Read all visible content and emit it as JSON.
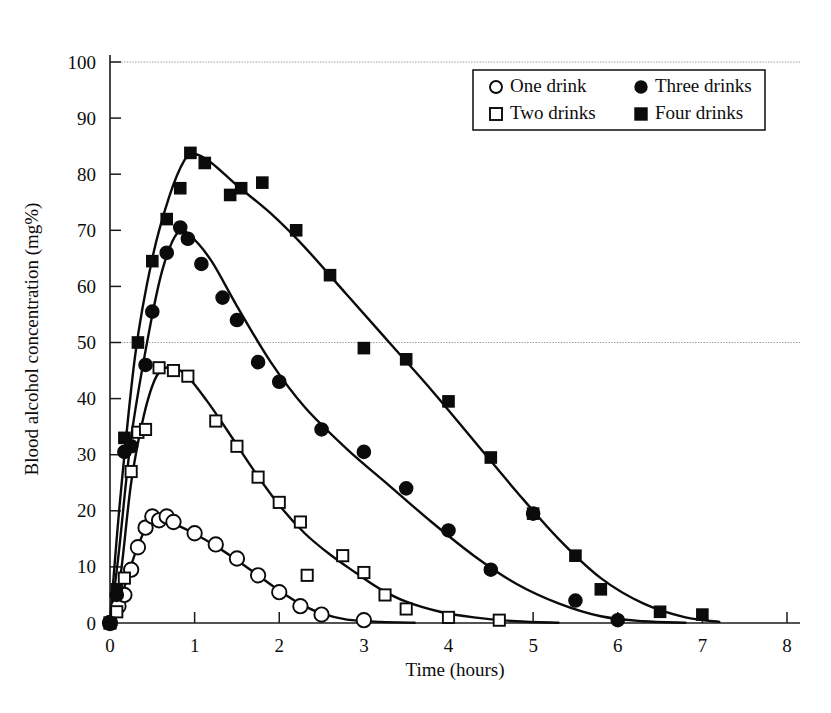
{
  "chart_data": {
    "type": "line",
    "title": "",
    "subtitle": "",
    "xlabel": "Time (hours)",
    "ylabel": "Blood alcohol concentration (mg%)",
    "xlim": [
      0,
      8
    ],
    "ylim": [
      0,
      105
    ],
    "xticks": [
      0,
      1,
      2,
      3,
      4,
      5,
      6,
      7,
      8
    ],
    "xtick_labels": [
      "0",
      "1",
      "2",
      "3",
      "4",
      "5",
      "6",
      "7",
      "8"
    ],
    "yticks": [
      0,
      10,
      20,
      30,
      40,
      50,
      60,
      70,
      80,
      90,
      100
    ],
    "ytick_labels": [
      "0",
      "10",
      "20",
      "30",
      "40",
      "50",
      "60",
      "70",
      "80",
      "90",
      "100"
    ],
    "grid": false,
    "reference_lines": [
      {
        "y": 50,
        "style": "dotted",
        "color": "#9a9a9a"
      },
      {
        "y": 100,
        "style": "dotted",
        "color": "#9a9a9a"
      }
    ],
    "legend_position": "top-right",
    "legend_entries": [
      "One drink",
      "Two drinks",
      "Three drinks",
      "Four drinks"
    ],
    "series": [
      {
        "name": "One drink",
        "marker": "open-circle",
        "points": [
          {
            "x": 0.0,
            "y": 0.0
          },
          {
            "x": 0.1,
            "y": 3.0
          },
          {
            "x": 0.17,
            "y": 5.0
          },
          {
            "x": 0.25,
            "y": 9.5
          },
          {
            "x": 0.33,
            "y": 13.5
          },
          {
            "x": 0.42,
            "y": 17.0
          },
          {
            "x": 0.5,
            "y": 19.0
          },
          {
            "x": 0.58,
            "y": 18.3
          },
          {
            "x": 0.67,
            "y": 19.0
          },
          {
            "x": 0.75,
            "y": 18.0
          },
          {
            "x": 1.0,
            "y": 16.0
          },
          {
            "x": 1.25,
            "y": 14.0
          },
          {
            "x": 1.5,
            "y": 11.5
          },
          {
            "x": 1.75,
            "y": 8.5
          },
          {
            "x": 2.0,
            "y": 5.5
          },
          {
            "x": 2.25,
            "y": 3.0
          },
          {
            "x": 2.5,
            "y": 1.5
          },
          {
            "x": 3.0,
            "y": 0.5
          }
        ],
        "curve": [
          {
            "x": 0.0,
            "y": 0.0
          },
          {
            "x": 0.15,
            "y": 5.5
          },
          {
            "x": 0.3,
            "y": 12.5
          },
          {
            "x": 0.45,
            "y": 17.6
          },
          {
            "x": 0.6,
            "y": 18.6
          },
          {
            "x": 0.8,
            "y": 17.4
          },
          {
            "x": 1.0,
            "y": 15.9
          },
          {
            "x": 1.25,
            "y": 13.7
          },
          {
            "x": 1.5,
            "y": 11.2
          },
          {
            "x": 1.75,
            "y": 8.5
          },
          {
            "x": 2.0,
            "y": 5.8
          },
          {
            "x": 2.25,
            "y": 3.4
          },
          {
            "x": 2.5,
            "y": 1.7
          },
          {
            "x": 2.8,
            "y": 0.6
          },
          {
            "x": 3.2,
            "y": 0.2
          },
          {
            "x": 3.6,
            "y": 0.05
          }
        ]
      },
      {
        "name": "Two drinks",
        "marker": "open-square",
        "points": [
          {
            "x": 0.0,
            "y": 0.0
          },
          {
            "x": 0.08,
            "y": 2.0
          },
          {
            "x": 0.17,
            "y": 8.0
          },
          {
            "x": 0.25,
            "y": 27.0
          },
          {
            "x": 0.33,
            "y": 34.0
          },
          {
            "x": 0.42,
            "y": 34.5
          },
          {
            "x": 0.58,
            "y": 45.5
          },
          {
            "x": 0.75,
            "y": 45.0
          },
          {
            "x": 0.92,
            "y": 44.0
          },
          {
            "x": 1.25,
            "y": 36.0
          },
          {
            "x": 1.5,
            "y": 31.5
          },
          {
            "x": 1.75,
            "y": 26.0
          },
          {
            "x": 2.0,
            "y": 21.5
          },
          {
            "x": 2.25,
            "y": 18.0
          },
          {
            "x": 2.33,
            "y": 8.5
          },
          {
            "x": 2.75,
            "y": 12.0
          },
          {
            "x": 3.0,
            "y": 9.0
          },
          {
            "x": 3.25,
            "y": 5.0
          },
          {
            "x": 3.5,
            "y": 2.5
          },
          {
            "x": 4.0,
            "y": 1.0
          },
          {
            "x": 4.6,
            "y": 0.5
          }
        ],
        "curve": [
          {
            "x": 0.0,
            "y": 0.0
          },
          {
            "x": 0.12,
            "y": 8.0
          },
          {
            "x": 0.25,
            "y": 25.0
          },
          {
            "x": 0.4,
            "y": 37.0
          },
          {
            "x": 0.55,
            "y": 44.0
          },
          {
            "x": 0.7,
            "y": 45.6
          },
          {
            "x": 0.9,
            "y": 44.2
          },
          {
            "x": 1.15,
            "y": 39.5
          },
          {
            "x": 1.4,
            "y": 34.0
          },
          {
            "x": 1.7,
            "y": 27.2
          },
          {
            "x": 2.0,
            "y": 21.0
          },
          {
            "x": 2.3,
            "y": 16.0
          },
          {
            "x": 2.6,
            "y": 12.2
          },
          {
            "x": 2.9,
            "y": 9.0
          },
          {
            "x": 3.2,
            "y": 6.0
          },
          {
            "x": 3.5,
            "y": 3.8
          },
          {
            "x": 3.9,
            "y": 2.0
          },
          {
            "x": 4.3,
            "y": 1.0
          },
          {
            "x": 4.8,
            "y": 0.3
          },
          {
            "x": 5.3,
            "y": 0.05
          }
        ]
      },
      {
        "name": "Three drinks",
        "marker": "filled-circle",
        "points": [
          {
            "x": 0.0,
            "y": 0.0
          },
          {
            "x": 0.08,
            "y": 5.0
          },
          {
            "x": 0.17,
            "y": 30.5
          },
          {
            "x": 0.25,
            "y": 31.5
          },
          {
            "x": 0.42,
            "y": 46.0
          },
          {
            "x": 0.5,
            "y": 55.5
          },
          {
            "x": 0.67,
            "y": 66.0
          },
          {
            "x": 0.83,
            "y": 70.5
          },
          {
            "x": 0.92,
            "y": 68.5
          },
          {
            "x": 1.08,
            "y": 64.0
          },
          {
            "x": 1.33,
            "y": 58.0
          },
          {
            "x": 1.5,
            "y": 54.0
          },
          {
            "x": 1.75,
            "y": 46.5
          },
          {
            "x": 2.0,
            "y": 43.0
          },
          {
            "x": 2.5,
            "y": 34.5
          },
          {
            "x": 3.0,
            "y": 30.5
          },
          {
            "x": 3.5,
            "y": 24.0
          },
          {
            "x": 4.0,
            "y": 16.5
          },
          {
            "x": 4.5,
            "y": 9.5
          },
          {
            "x": 5.0,
            "y": 19.5
          },
          {
            "x": 5.5,
            "y": 4.0
          },
          {
            "x": 6.0,
            "y": 0.5
          }
        ],
        "curve": [
          {
            "x": 0.0,
            "y": 0.0
          },
          {
            "x": 0.1,
            "y": 12.0
          },
          {
            "x": 0.25,
            "y": 33.0
          },
          {
            "x": 0.45,
            "y": 51.0
          },
          {
            "x": 0.62,
            "y": 63.0
          },
          {
            "x": 0.8,
            "y": 69.6
          },
          {
            "x": 0.95,
            "y": 69.0
          },
          {
            "x": 1.2,
            "y": 64.5
          },
          {
            "x": 1.5,
            "y": 56.5
          },
          {
            "x": 1.9,
            "y": 46.5
          },
          {
            "x": 2.3,
            "y": 38.5
          },
          {
            "x": 2.8,
            "y": 31.0
          },
          {
            "x": 3.3,
            "y": 24.5
          },
          {
            "x": 3.8,
            "y": 18.0
          },
          {
            "x": 4.3,
            "y": 12.0
          },
          {
            "x": 4.8,
            "y": 7.0
          },
          {
            "x": 5.3,
            "y": 3.5
          },
          {
            "x": 5.8,
            "y": 1.2
          },
          {
            "x": 6.3,
            "y": 0.3
          },
          {
            "x": 6.8,
            "y": 0.05
          }
        ]
      },
      {
        "name": "Four drinks",
        "marker": "filled-square",
        "points": [
          {
            "x": 0.0,
            "y": 0.0
          },
          {
            "x": 0.08,
            "y": 6.0
          },
          {
            "x": 0.17,
            "y": 33.0
          },
          {
            "x": 0.33,
            "y": 50.0
          },
          {
            "x": 0.5,
            "y": 64.5
          },
          {
            "x": 0.67,
            "y": 72.0
          },
          {
            "x": 0.83,
            "y": 77.5
          },
          {
            "x": 0.95,
            "y": 83.8
          },
          {
            "x": 1.12,
            "y": 82.0
          },
          {
            "x": 1.42,
            "y": 76.3
          },
          {
            "x": 1.55,
            "y": 77.5
          },
          {
            "x": 1.8,
            "y": 78.5
          },
          {
            "x": 2.2,
            "y": 70.0
          },
          {
            "x": 2.6,
            "y": 62.0
          },
          {
            "x": 3.0,
            "y": 49.0
          },
          {
            "x": 3.5,
            "y": 47.0
          },
          {
            "x": 4.0,
            "y": 39.5
          },
          {
            "x": 4.5,
            "y": 29.5
          },
          {
            "x": 5.0,
            "y": 19.5
          },
          {
            "x": 5.5,
            "y": 12.0
          },
          {
            "x": 5.8,
            "y": 6.0
          },
          {
            "x": 6.5,
            "y": 2.0
          },
          {
            "x": 7.0,
            "y": 1.5
          }
        ],
        "curve": [
          {
            "x": 0.0,
            "y": 0.0
          },
          {
            "x": 0.12,
            "y": 22.0
          },
          {
            "x": 0.3,
            "y": 48.0
          },
          {
            "x": 0.5,
            "y": 65.0
          },
          {
            "x": 0.7,
            "y": 76.0
          },
          {
            "x": 0.88,
            "y": 82.5
          },
          {
            "x": 1.0,
            "y": 83.6
          },
          {
            "x": 1.2,
            "y": 82.0
          },
          {
            "x": 1.5,
            "y": 78.0
          },
          {
            "x": 1.9,
            "y": 73.0
          },
          {
            "x": 2.3,
            "y": 67.0
          },
          {
            "x": 2.8,
            "y": 58.5
          },
          {
            "x": 3.3,
            "y": 50.0
          },
          {
            "x": 3.8,
            "y": 41.5
          },
          {
            "x": 4.3,
            "y": 32.5
          },
          {
            "x": 4.8,
            "y": 23.5
          },
          {
            "x": 5.3,
            "y": 15.0
          },
          {
            "x": 5.8,
            "y": 8.0
          },
          {
            "x": 6.3,
            "y": 3.5
          },
          {
            "x": 6.8,
            "y": 1.0
          },
          {
            "x": 7.2,
            "y": 0.2
          }
        ]
      }
    ]
  },
  "legend": {
    "entries": [
      {
        "label": "One drink",
        "marker": "open-circle"
      },
      {
        "label": "Three drinks",
        "marker": "filled-circle"
      },
      {
        "label": "Two drinks",
        "marker": "open-square"
      },
      {
        "label": "Four drinks",
        "marker": "filled-square"
      }
    ]
  },
  "axes": {
    "x_title": "Time (hours)",
    "y_title": "Blood alcohol concentration (mg%)",
    "x_tick_labels": [
      "0",
      "1",
      "2",
      "3",
      "4",
      "5",
      "6",
      "7",
      "8"
    ],
    "y_tick_labels": [
      "0",
      "10",
      "20",
      "30",
      "40",
      "50",
      "60",
      "70",
      "80",
      "90",
      "100"
    ]
  },
  "colors": {
    "axis": "#1a1a1a",
    "curve": "#0b0b0b",
    "reference_line": "#9a9a9a",
    "background": "#ffffff",
    "marker_fill_open": "#ffffff"
  }
}
